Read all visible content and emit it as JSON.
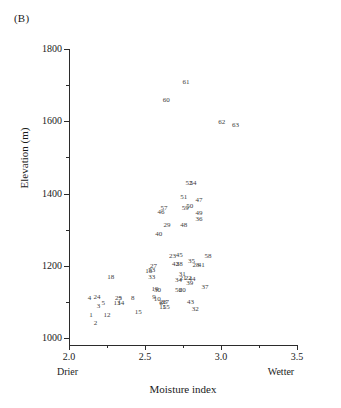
{
  "figure": {
    "panel_label": "(B)",
    "x_axis_title": "Moisture index",
    "y_axis_title": "Elevation (m)",
    "x_low_annotation": "Drier",
    "x_high_annotation": "Wetter",
    "point_color": "#3c3c3c",
    "axis_color": "#2b2b2b"
  },
  "chart_data": {
    "type": "scatter",
    "title": "(B)",
    "xlabel": "Moisture index",
    "ylabel": "Elevation (m)",
    "xlim": [
      2.0,
      3.5
    ],
    "ylim": [
      980,
      1810
    ],
    "grid": false,
    "legend": null,
    "x_ticks": [
      "2.0",
      "2.5",
      "3.0",
      "3.5"
    ],
    "x_tick_values": [
      2.0,
      2.5,
      3.0,
      3.5
    ],
    "x_minor_tick_values": [
      2.25,
      2.75,
      3.25
    ],
    "y_ticks": [
      "1000",
      "1200",
      "1400",
      "1600",
      "1800"
    ],
    "y_tick_values": [
      1000,
      1200,
      1400,
      1600,
      1800
    ],
    "y_minor_tick_values": [
      1100,
      1300,
      1500,
      1700
    ],
    "annotations": [
      {
        "text": "Drier",
        "position": "x-axis-left"
      },
      {
        "text": "Wetter",
        "position": "x-axis-right"
      }
    ],
    "point_labels_are_ids": true,
    "points": [
      {
        "label": "1",
        "x": 2.145,
        "y": 1063
      },
      {
        "label": "2",
        "x": 2.175,
        "y": 1042
      },
      {
        "label": "3",
        "x": 2.195,
        "y": 1090
      },
      {
        "label": "4",
        "x": 2.135,
        "y": 1112
      },
      {
        "label": "5",
        "x": 2.225,
        "y": 1097
      },
      {
        "label": "6",
        "x": 2.605,
        "y": 1098
      },
      {
        "label": "7",
        "x": 2.335,
        "y": 1108
      },
      {
        "label": "8",
        "x": 2.42,
        "y": 1110
      },
      {
        "label": "9",
        "x": 2.56,
        "y": 1113
      },
      {
        "label": "10",
        "x": 2.58,
        "y": 1108
      },
      {
        "label": "11",
        "x": 2.615,
        "y": 1087
      },
      {
        "label": "12",
        "x": 2.25,
        "y": 1065
      },
      {
        "label": "13",
        "x": 2.315,
        "y": 1096
      },
      {
        "label": "14",
        "x": 2.34,
        "y": 1096
      },
      {
        "label": "15",
        "x": 2.455,
        "y": 1073
      },
      {
        "label": "16",
        "x": 2.525,
        "y": 1186
      },
      {
        "label": "17",
        "x": 2.635,
        "y": 1099
      },
      {
        "label": "18",
        "x": 2.275,
        "y": 1168
      },
      {
        "label": "19",
        "x": 2.565,
        "y": 1136
      },
      {
        "label": "20",
        "x": 2.745,
        "y": 1134
      },
      {
        "label": "21",
        "x": 2.75,
        "y": 1165
      },
      {
        "label": "22",
        "x": 2.785,
        "y": 1165
      },
      {
        "label": "23",
        "x": 2.68,
        "y": 1228
      },
      {
        "label": "24",
        "x": 2.185,
        "y": 1115
      },
      {
        "label": "25",
        "x": 2.325,
        "y": 1110
      },
      {
        "label": "26",
        "x": 2.62,
        "y": 1100
      },
      {
        "label": "27",
        "x": 2.555,
        "y": 1200
      },
      {
        "label": "28",
        "x": 2.835,
        "y": 1203
      },
      {
        "label": "29",
        "x": 2.645,
        "y": 1312
      },
      {
        "label": "30",
        "x": 2.582,
        "y": 1132
      },
      {
        "label": "31",
        "x": 2.745,
        "y": 1178
      },
      {
        "label": "32",
        "x": 2.83,
        "y": 1080
      },
      {
        "label": "33",
        "x": 2.545,
        "y": 1168
      },
      {
        "label": "34",
        "x": 2.72,
        "y": 1160
      },
      {
        "label": "35",
        "x": 2.805,
        "y": 1212
      },
      {
        "label": "36",
        "x": 2.855,
        "y": 1330
      },
      {
        "label": "37",
        "x": 2.895,
        "y": 1140
      },
      {
        "label": "38",
        "x": 2.725,
        "y": 1205
      },
      {
        "label": "39",
        "x": 2.795,
        "y": 1152
      },
      {
        "label": "40",
        "x": 2.59,
        "y": 1288
      },
      {
        "label": "41",
        "x": 2.87,
        "y": 1203
      },
      {
        "label": "42",
        "x": 2.7,
        "y": 1206
      },
      {
        "label": "43",
        "x": 2.8,
        "y": 1100
      },
      {
        "label": "44",
        "x": 2.81,
        "y": 1163
      },
      {
        "label": "45",
        "x": 2.725,
        "y": 1231
      },
      {
        "label": "46",
        "x": 2.605,
        "y": 1350
      },
      {
        "label": "47",
        "x": 2.855,
        "y": 1382
      },
      {
        "label": "48",
        "x": 2.755,
        "y": 1312
      },
      {
        "label": "49",
        "x": 2.855,
        "y": 1345
      },
      {
        "label": "50",
        "x": 2.795,
        "y": 1365
      },
      {
        "label": "51",
        "x": 2.755,
        "y": 1390
      },
      {
        "label": "52",
        "x": 2.79,
        "y": 1428
      },
      {
        "label": "53",
        "x": 2.545,
        "y": 1188
      },
      {
        "label": "54",
        "x": 2.815,
        "y": 1428
      },
      {
        "label": "55",
        "x": 2.64,
        "y": 1086
      },
      {
        "label": "56",
        "x": 2.72,
        "y": 1133
      },
      {
        "label": "57",
        "x": 2.625,
        "y": 1360
      },
      {
        "label": "58",
        "x": 2.915,
        "y": 1228
      },
      {
        "label": "59",
        "x": 2.765,
        "y": 1360
      },
      {
        "label": "60",
        "x": 2.64,
        "y": 1660
      },
      {
        "label": "61",
        "x": 2.77,
        "y": 1708
      },
      {
        "label": "62",
        "x": 3.005,
        "y": 1598
      },
      {
        "label": "63",
        "x": 3.095,
        "y": 1590
      }
    ]
  }
}
